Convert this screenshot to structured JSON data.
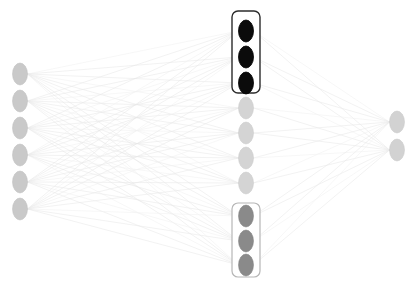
{
  "diagram": {
    "type": "feedforward-neural-network",
    "canvas": {
      "width": 410,
      "height": 289,
      "background": "#ffffff"
    },
    "node_shape": "ellipse",
    "node_rx": 7.5,
    "node_ry": 11,
    "colors": {
      "input_node_fill": "#c9c9c9",
      "input_node_stroke": "#bdbdbd",
      "hidden_active_fill": "#0b0b0b",
      "hidden_active_stroke": "#000000",
      "hidden_inactive_fill": "#d4d4d4",
      "hidden_inactive_stroke": "#c8c8c8",
      "hidden_selected_fill": "#8a8a8a",
      "hidden_selected_stroke": "#7d7d7d",
      "output_node_fill": "#d2d2d2",
      "output_node_stroke": "#c6c6c6",
      "edge": "#e8e8e8",
      "edge_faint": "#f1f1f1",
      "box_stroke_dark": "#2b2b2b",
      "box_stroke_light": "#b6b6b6",
      "box_fill": "#ffffff"
    },
    "layers": [
      {
        "name": "input-layer",
        "label": "Input Layer",
        "x": 20,
        "count": 6,
        "node_state": "input",
        "nodes": [
          {
            "id": "in-1",
            "x": 20,
            "y": 74,
            "state": "input"
          },
          {
            "id": "in-2",
            "x": 20,
            "y": 101,
            "state": "input"
          },
          {
            "id": "in-3",
            "x": 20,
            "y": 128,
            "state": "input"
          },
          {
            "id": "in-4",
            "x": 20,
            "y": 155,
            "state": "input"
          },
          {
            "id": "in-5",
            "x": 20,
            "y": 182,
            "state": "input"
          },
          {
            "id": "in-6",
            "x": 20,
            "y": 209,
            "state": "input"
          }
        ]
      },
      {
        "name": "hidden-layer",
        "label": "Hidden Layer",
        "x": 246,
        "count": 10,
        "nodes": [
          {
            "id": "h-1",
            "x": 246,
            "y": 31,
            "state": "active"
          },
          {
            "id": "h-2",
            "x": 246,
            "y": 57,
            "state": "active"
          },
          {
            "id": "h-3",
            "x": 246,
            "y": 83,
            "state": "active"
          },
          {
            "id": "h-4",
            "x": 246,
            "y": 108,
            "state": "inactive"
          },
          {
            "id": "h-5",
            "x": 246,
            "y": 133,
            "state": "inactive"
          },
          {
            "id": "h-6",
            "x": 246,
            "y": 158,
            "state": "inactive"
          },
          {
            "id": "h-7",
            "x": 246,
            "y": 183,
            "state": "inactive"
          },
          {
            "id": "h-8",
            "x": 246,
            "y": 216,
            "state": "selected"
          },
          {
            "id": "h-9",
            "x": 246,
            "y": 241,
            "state": "selected"
          },
          {
            "id": "h-10",
            "x": 246,
            "y": 265,
            "state": "selected"
          }
        ]
      },
      {
        "name": "output-layer",
        "label": "Output Layer",
        "x": 397,
        "count": 2,
        "node_state": "output",
        "nodes": [
          {
            "id": "out-1",
            "x": 397,
            "y": 122,
            "state": "output"
          },
          {
            "id": "out-2",
            "x": 397,
            "y": 150,
            "state": "output"
          }
        ]
      }
    ],
    "group_boxes": [
      {
        "id": "group-box-top",
        "name": "hidden-group-highlight-top",
        "x": 232,
        "y": 11,
        "width": 28,
        "height": 82,
        "rx": 6,
        "stroke": "#2b2b2b",
        "stroke_width": 1.4,
        "members": [
          "h-1",
          "h-2",
          "h-3"
        ]
      },
      {
        "id": "group-box-bottom",
        "name": "hidden-group-highlight-bottom",
        "x": 232,
        "y": 203,
        "width": 28,
        "height": 74,
        "rx": 6,
        "stroke": "#b6b6b6",
        "stroke_width": 1.2,
        "members": [
          "h-8",
          "h-9",
          "h-10"
        ]
      }
    ],
    "edge_groups": [
      {
        "name": "input-to-hidden",
        "from_layer": "input-layer",
        "to_layer": "hidden-layer",
        "fully_connected": true,
        "edge_count": 60,
        "color": "#e8e8e8",
        "stroke_width": 0.55
      },
      {
        "name": "hidden-to-output",
        "from_layer": "hidden-layer",
        "to_layer": "output-layer",
        "fully_connected": true,
        "edge_count": 20,
        "color": "#e8e8e8",
        "stroke_width": 0.55
      }
    ]
  }
}
